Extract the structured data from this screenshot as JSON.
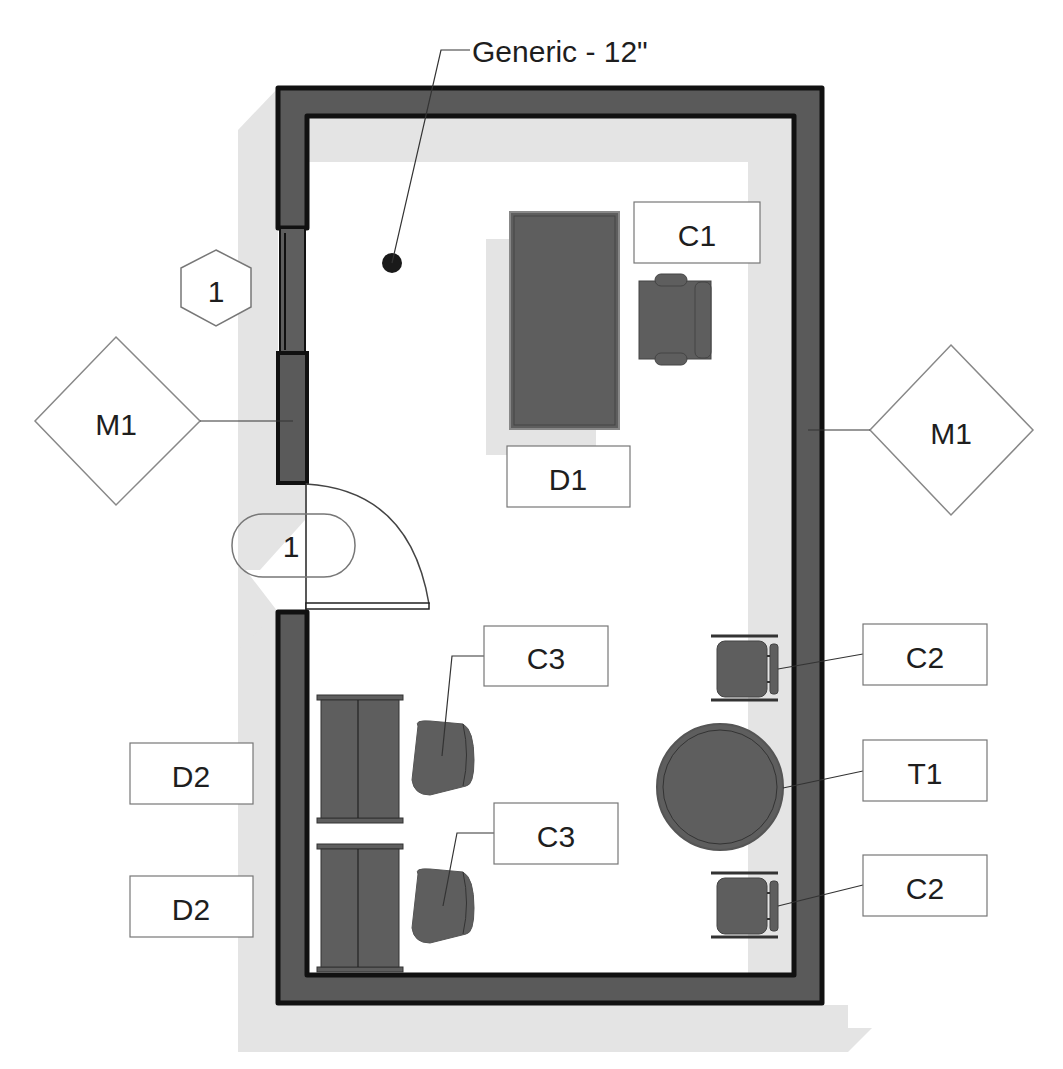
{
  "colors": {
    "wall_fill": "#5a5a5a",
    "wall_edge": "#111111",
    "furniture_fill": "#5e5e5e",
    "shadow": "#e3e3e3",
    "tag_border": "#7a7a7a",
    "text": "#1e1e1e"
  },
  "wall_label": {
    "text": "Generic - 12\""
  },
  "window_tag": {
    "text": "1",
    "shape": "hexagon"
  },
  "door_tag": {
    "text": "1",
    "shape": "rounded-rectangle"
  },
  "material_tags": [
    {
      "text": "M1",
      "side": "left",
      "shape": "diamond"
    },
    {
      "text": "M1",
      "side": "right",
      "shape": "diamond"
    }
  ],
  "furniture_tags": {
    "c1": "C1",
    "d1": "D1",
    "c2_top": "C2",
    "t1": "T1",
    "c2_bottom": "C2",
    "c3_top": "C3",
    "c3_bottom": "C3",
    "d2_top": "D2",
    "d2_bottom": "D2"
  },
  "furniture": [
    {
      "id": "D1",
      "type": "desk",
      "icon": "desk-icon"
    },
    {
      "id": "C1",
      "type": "armchair",
      "icon": "armchair-icon"
    },
    {
      "id": "C2",
      "type": "office-chair",
      "icon": "chair-icon",
      "count": 2
    },
    {
      "id": "T1",
      "type": "round-table",
      "icon": "round-table-icon"
    },
    {
      "id": "C3",
      "type": "lounge-chair",
      "icon": "chair-icon",
      "count": 2
    },
    {
      "id": "D2",
      "type": "cabinet",
      "icon": "cabinet-icon",
      "count": 2
    }
  ]
}
